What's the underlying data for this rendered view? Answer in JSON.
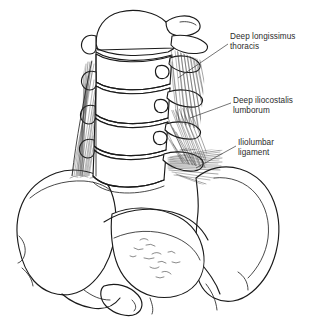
{
  "figure": {
    "background_color": "#ffffff",
    "line_color": "#1a1a1a",
    "text_color": "#2b2b2b",
    "width": 329,
    "height": 317
  },
  "labels": [
    {
      "id": "deep-longissimus-thoracis",
      "text": "Deep longissimus\nthoracis",
      "line1": "Deep longissimus",
      "line2": "thoracis",
      "x": 230,
      "y": 32,
      "leader_from": [
        228,
        44
      ],
      "leader_to": [
        178,
        78
      ]
    },
    {
      "id": "deep-iliocostalis-lumborum",
      "text": "Deep iliocostalis\nlumborum",
      "line1": "Deep iliocostalis",
      "line2": "lumborum",
      "x": 233,
      "y": 96,
      "leader_from": [
        231,
        103
      ],
      "leader_to": [
        190,
        118
      ]
    },
    {
      "id": "iliolumbar-ligament",
      "text": "Iliolumbar\nligament",
      "line1": "Iliolumbar",
      "line2": "ligament",
      "x": 238,
      "y": 138,
      "leader_from": [
        236,
        146
      ],
      "leader_to": [
        196,
        168
      ]
    }
  ],
  "structures": {
    "vertebrae_count": 5,
    "parts": [
      "lumbar vertebral bodies",
      "transverse processes",
      "intervertebral discs",
      "left ilium",
      "right ilium",
      "iliac crest",
      "sacrum",
      "obturator foramen",
      "deep longissimus thoracis fibers",
      "deep iliocostalis lumborum fibers",
      "iliolumbar ligament fibers"
    ]
  }
}
